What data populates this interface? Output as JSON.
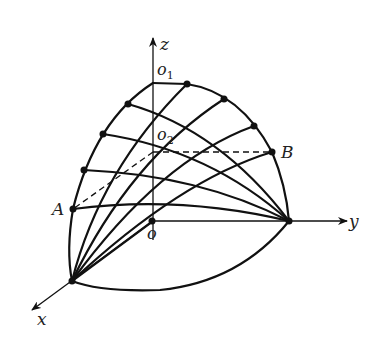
{
  "figure": {
    "type": "3D coordinate diagram of a curved surface with grid lines",
    "axes": {
      "x": "x",
      "y": "y",
      "z": "z"
    },
    "points": {
      "origin": "o",
      "o1": "o",
      "o1_sub": "1",
      "o2": "o",
      "o2_sub": "2",
      "A": "A",
      "B": "B"
    },
    "colors": {
      "stroke": "#111111",
      "background": "#ffffff"
    }
  }
}
